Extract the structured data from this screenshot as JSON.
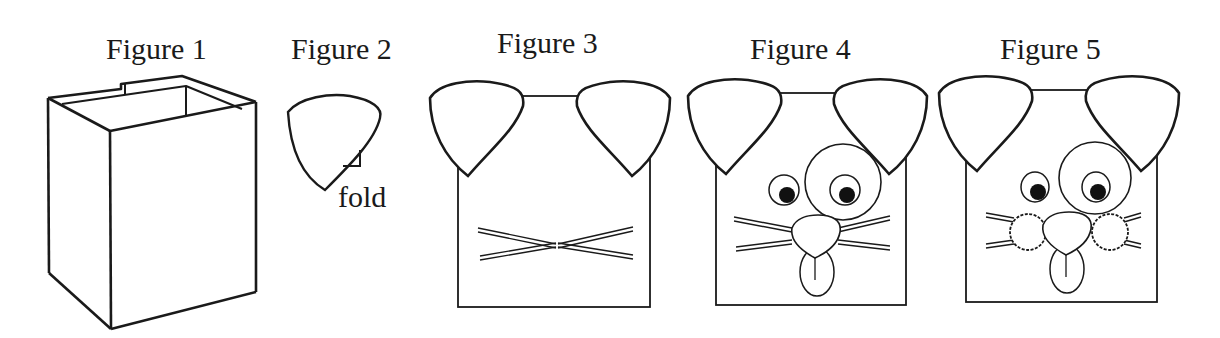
{
  "figures": [
    {
      "id": 1,
      "caption": "Figure 1",
      "subject": "open rectangular box (paper bag / carton)"
    },
    {
      "id": 2,
      "caption": "Figure 2",
      "subject": "single ear cut-out",
      "annotation": "fold"
    },
    {
      "id": 3,
      "caption": "Figure 3",
      "subject": "box with two ears and crossed whisker straws"
    },
    {
      "id": 4,
      "caption": "Figure 4",
      "subject": "dog face with eyes, eye patch, nose, tongue and whiskers"
    },
    {
      "id": 5,
      "caption": "Figure 5",
      "subject": "dog face with pom-pom cheeks added"
    }
  ],
  "colors": {
    "stroke": "#1a1a1a",
    "background": "#ffffff",
    "pupil": "#111111"
  }
}
